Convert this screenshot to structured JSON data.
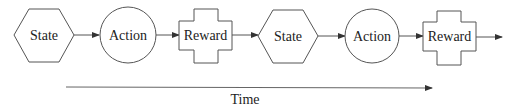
{
  "diagram": {
    "nodes": [
      {
        "id": "state-1",
        "shape": "hexagon",
        "label": "State"
      },
      {
        "id": "action-1",
        "shape": "circle",
        "label": "Action"
      },
      {
        "id": "reward-1",
        "shape": "cross",
        "label": "Reward"
      },
      {
        "id": "state-2",
        "shape": "hexagon",
        "label": "State"
      },
      {
        "id": "action-2",
        "shape": "circle",
        "label": "Action"
      },
      {
        "id": "reward-2",
        "shape": "cross",
        "label": "Reward"
      }
    ],
    "edges": [
      [
        "state-1",
        "action-1"
      ],
      [
        "action-1",
        "reward-1"
      ],
      [
        "reward-1",
        "state-2"
      ],
      [
        "state-2",
        "action-2"
      ],
      [
        "action-2",
        "reward-2"
      ],
      [
        "reward-2",
        "out"
      ]
    ],
    "timeline": {
      "label": "Time"
    },
    "colors": {
      "stroke": "#555555",
      "text": "#222222",
      "background": "#ffffff"
    }
  }
}
